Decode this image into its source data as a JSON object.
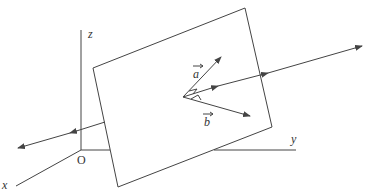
{
  "diagram": {
    "axes": {
      "x_label": "x",
      "y_label": "y",
      "z_label": "z",
      "origin_label": "O"
    },
    "vectors": {
      "a_label": "a",
      "b_label": "b"
    },
    "colors": {
      "stroke": "#444444",
      "text": "#333333",
      "background": "#ffffff"
    }
  }
}
